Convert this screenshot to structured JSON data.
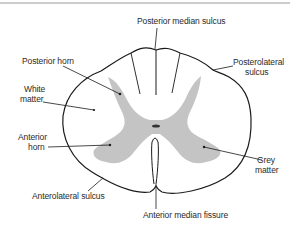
{
  "diagram": {
    "colors": {
      "outline": "#1a1a1a",
      "grey_matter": "#c4c4c4",
      "label_text": "#2a2a2a",
      "top_rule": "#9a9a9a",
      "background": "#ffffff"
    },
    "labels": {
      "posterior_median_sulcus": "Posterior median sulcus",
      "posterior_horn": "Posterior horn",
      "posterolateral_sulcus_line1": "Posterolateral",
      "posterolateral_sulcus_line2": "sulcus",
      "white_matter_line1": "White",
      "white_matter_line2": "matter",
      "anterior_horn_line1": "Anterior",
      "anterior_horn_line2": "horn",
      "grey_matter_line1": "Grey",
      "grey_matter_line2": "matter",
      "anterolateral_sulcus": "Anterolateral sulcus",
      "anterior_median_fissure": "Anterior median fissure"
    }
  }
}
